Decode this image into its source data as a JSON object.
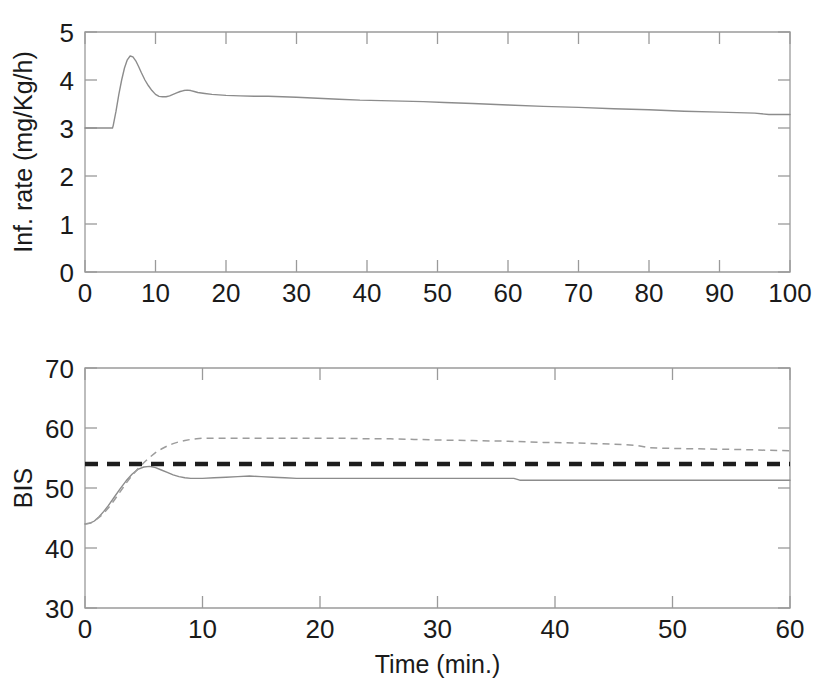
{
  "figure": {
    "background_color": "#ffffff",
    "panels": [
      "infusion-rate-panel",
      "bis-panel"
    ]
  },
  "chart_data": [
    {
      "id": "infusion-rate",
      "type": "line",
      "title": "",
      "xlabel": "",
      "ylabel": "Inf. rate (mg/Kg/h)",
      "xlim": [
        0,
        100
      ],
      "ylim": [
        0,
        5
      ],
      "xticks": [
        0,
        10,
        20,
        30,
        40,
        50,
        60,
        70,
        80,
        90,
        100
      ],
      "xticklabels": [
        "0",
        "10",
        "20",
        "30",
        "40",
        "50",
        "60",
        "70",
        "80",
        "90",
        "100"
      ],
      "yticks": [
        0,
        1,
        2,
        3,
        4,
        5
      ],
      "yticklabels": [
        "0",
        "1",
        "2",
        "3",
        "4",
        "5"
      ],
      "grid": false,
      "legend": "none",
      "series": [
        {
          "name": "infusion rate",
          "style": "solid",
          "color": "#8c8c8c",
          "x": [
            0,
            1,
            2,
            3,
            3.9,
            4.0,
            4.4,
            4.8,
            5.2,
            5.6,
            6.0,
            6.4,
            6.8,
            7.2,
            7.6,
            8.0,
            8.5,
            9.0,
            9.5,
            10.0,
            10.5,
            11.0,
            11.5,
            12.0,
            12.5,
            13.0,
            13.5,
            14.0,
            14.5,
            15.0,
            15.5,
            16.0,
            17.0,
            18.0,
            19.0,
            20.0,
            22.0,
            24.0,
            26.0,
            28.0,
            30.0,
            33.0,
            36.0,
            39.0,
            42.0,
            45.0,
            48.0,
            51.0,
            55.0,
            60.0,
            65.0,
            70.0,
            75.0,
            80.0,
            85.0,
            90.0,
            95.0,
            97.0,
            100.0
          ],
          "y": [
            3.0,
            3.0,
            3.0,
            3.0,
            3.0,
            3.05,
            3.35,
            3.7,
            4.0,
            4.25,
            4.42,
            4.5,
            4.48,
            4.4,
            4.28,
            4.15,
            4.0,
            3.88,
            3.78,
            3.7,
            3.66,
            3.65,
            3.65,
            3.67,
            3.7,
            3.73,
            3.76,
            3.78,
            3.79,
            3.78,
            3.76,
            3.74,
            3.72,
            3.7,
            3.69,
            3.68,
            3.67,
            3.66,
            3.66,
            3.65,
            3.64,
            3.62,
            3.6,
            3.58,
            3.57,
            3.56,
            3.55,
            3.53,
            3.51,
            3.48,
            3.45,
            3.43,
            3.4,
            3.38,
            3.35,
            3.33,
            3.31,
            3.28,
            3.28
          ],
          "notes": "starts flat at 3.0 until t=4 min, overshoots to peak 4.5 at t~6.5 min, settles with small secondary bump ~3.8 at t~14.5 min, then slowly decays to ~3.28 at t=100 min"
        }
      ]
    },
    {
      "id": "bis",
      "type": "line",
      "title": "",
      "xlabel": "Time (min.)",
      "ylabel": "BIS",
      "xlim": [
        0,
        60
      ],
      "ylim": [
        30,
        70
      ],
      "xticks": [
        0,
        10,
        20,
        30,
        40,
        50,
        60
      ],
      "xticklabels": [
        "0",
        "10",
        "20",
        "30",
        "40",
        "50",
        "60"
      ],
      "yticks": [
        30,
        40,
        50,
        60,
        70
      ],
      "yticklabels": [
        "30",
        "40",
        "50",
        "60",
        "70"
      ],
      "grid": false,
      "legend": "none",
      "series": [
        {
          "name": "BIS response (solid)",
          "style": "solid",
          "color": "#8c8c8c",
          "x": [
            0,
            0.4,
            0.8,
            1.2,
            1.6,
            2.0,
            2.5,
            3.0,
            3.5,
            4.0,
            4.5,
            5.0,
            5.5,
            6.0,
            6.5,
            7.0,
            7.5,
            8.0,
            8.5,
            9.0,
            9.5,
            10.0,
            11.0,
            12.0,
            13.0,
            14.0,
            15.0,
            16.0,
            17.0,
            18.0,
            20.0,
            24.0,
            28.0,
            32.0,
            35.0,
            36.5,
            37.0,
            40.0,
            45.0,
            50.0,
            55.0,
            60.0
          ],
          "y": [
            44.0,
            44.1,
            44.5,
            45.2,
            46.1,
            47.1,
            48.5,
            49.9,
            51.2,
            52.3,
            53.1,
            53.5,
            53.6,
            53.4,
            53.0,
            52.6,
            52.2,
            51.9,
            51.7,
            51.6,
            51.6,
            51.6,
            51.7,
            51.8,
            51.9,
            52.0,
            51.9,
            51.8,
            51.7,
            51.6,
            51.6,
            51.6,
            51.6,
            51.6,
            51.6,
            51.6,
            51.3,
            51.3,
            51.3,
            51.3,
            51.3,
            51.3
          ],
          "notes": "starts at 44, rises to slight overshoot ~53.6 at t~5.5 min, settles near 51.6 and steps slightly down to 51.3 after t~37 min"
        },
        {
          "name": "BIS response (dashed)",
          "style": "dashed",
          "color": "#9c9c9c",
          "x": [
            0,
            0.5,
            1.0,
            1.5,
            2.0,
            2.5,
            3.0,
            3.5,
            4.0,
            4.5,
            5.0,
            5.5,
            6.0,
            6.5,
            7.0,
            7.5,
            8.0,
            8.5,
            9.0,
            9.5,
            10.0,
            10.5,
            11.0,
            12.0,
            14.0,
            16.0,
            18.0,
            20.0,
            22.0,
            24.0,
            26.0,
            28.0,
            30.0,
            33.0,
            36.0,
            39.0,
            42.0,
            45.0,
            47.0,
            48.0,
            50.0,
            53.0,
            56.0,
            58.0,
            60.0
          ],
          "y": [
            44.0,
            44.2,
            44.8,
            45.6,
            46.7,
            48.0,
            49.4,
            50.8,
            52.1,
            53.2,
            54.2,
            55.1,
            55.9,
            56.5,
            57.0,
            57.4,
            57.7,
            57.9,
            58.1,
            58.2,
            58.3,
            58.3,
            58.3,
            58.3,
            58.3,
            58.3,
            58.3,
            58.3,
            58.3,
            58.2,
            58.2,
            58.1,
            58.0,
            57.9,
            57.8,
            57.6,
            57.5,
            57.3,
            57.1,
            56.7,
            56.6,
            56.5,
            56.4,
            56.3,
            56.2
          ],
          "notes": "starts at 44, rises monotonically to plateau ~58.3 around t=10 min, then slowly drifts down to ~56.2 at t=60 min"
        },
        {
          "name": "BIS target reference",
          "style": "thick-dashed",
          "color": "#1d1d1d",
          "x": [
            0,
            60
          ],
          "y": [
            54.0,
            54.0
          ],
          "notes": "horizontal thick black dashed setpoint line at BIS = 54"
        }
      ]
    }
  ]
}
